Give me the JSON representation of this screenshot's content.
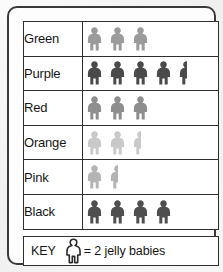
{
  "chart_data": {
    "type": "bar",
    "chart_style": "pictogram",
    "title": "",
    "xlabel": "",
    "ylabel": "",
    "categories": [
      "Green",
      "Purple",
      "Red",
      "Orange",
      "Pink",
      "Black"
    ],
    "values": [
      6,
      9,
      6,
      5,
      3,
      8
    ],
    "symbol_counts": [
      3,
      4.5,
      3,
      2.5,
      1.5,
      4
    ],
    "symbol_value": 2,
    "symbol_name": "jelly-baby-figure",
    "unit": "jelly babies",
    "grid": false,
    "legend_position": "bottom",
    "rows": [
      {
        "label": "Green",
        "value": 6,
        "full_figures": 3,
        "half_figure": false,
        "figure_color": "#9b9b9b"
      },
      {
        "label": "Purple",
        "value": 9,
        "full_figures": 4,
        "half_figure": true,
        "figure_color": "#4a4a4a"
      },
      {
        "label": "Red",
        "value": 6,
        "full_figures": 3,
        "half_figure": false,
        "figure_color": "#8e8e8e"
      },
      {
        "label": "Orange",
        "value": 5,
        "full_figures": 2,
        "half_figure": true,
        "figure_color": "#c9c9c9"
      },
      {
        "label": "Pink",
        "value": 3,
        "full_figures": 1,
        "half_figure": true,
        "figure_color": "#b4b4b4"
      },
      {
        "label": "Black",
        "value": 8,
        "full_figures": 4,
        "half_figure": false,
        "figure_color": "#4f4f4f"
      }
    ]
  },
  "key": {
    "label": "KEY",
    "equals_text": "= 2 jelly babies",
    "symbol_fill": "#ffffff",
    "symbol_stroke": "#2b2b2b"
  },
  "colors": {
    "frame": "#3a3a3a",
    "grid_line": "#2f2f2f",
    "cell_background": "#ffffff",
    "page_background": "#f2f2f2",
    "text": "#161616"
  }
}
